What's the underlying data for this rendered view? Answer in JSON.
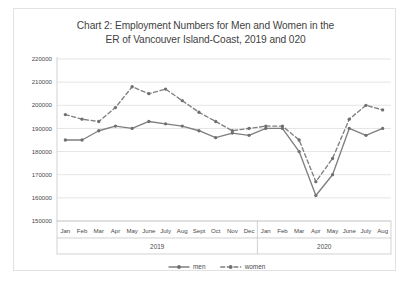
{
  "chart_data": {
    "type": "line",
    "title": "Chart 2: Employment Numbers for Men and Women in the ER of Vancouver Island-Coast, 2019 and 020",
    "title_line1": "Chart 2: Employment Numbers for Men and Women in the",
    "title_line2": "ER of Vancouver Island-Coast, 2019 and 020",
    "xlabel": "",
    "ylabel": "",
    "ylim": [
      150000,
      220000
    ],
    "ytick_step": 10000,
    "ytick_labels": [
      "220000",
      "210000",
      "200000",
      "190000",
      "180000",
      "170000",
      "160000",
      "150000"
    ],
    "ytick_values": [
      220000,
      210000,
      200000,
      190000,
      180000,
      170000,
      160000,
      150000
    ],
    "grid": true,
    "grid_axis": "y",
    "legend_position": "bottom",
    "categories": [
      "Jan",
      "Feb",
      "Mar",
      "Apr",
      "May",
      "June",
      "July",
      "Aug",
      "Sept",
      "Oct",
      "Nov",
      "Dec",
      "Jan",
      "Feb",
      "Mar",
      "Apr",
      "May",
      "June",
      "July",
      "Aug"
    ],
    "group_labels": [
      {
        "label": "2019",
        "start_index": 0,
        "end_index": 11
      },
      {
        "label": "2020",
        "start_index": 12,
        "end_index": 19
      }
    ],
    "series": [
      {
        "name": "men",
        "style": "solid",
        "color": "#7f7f7f",
        "values": [
          185000,
          185000,
          189000,
          191000,
          190000,
          193000,
          192000,
          191000,
          189000,
          186000,
          188000,
          187000,
          190000,
          190000,
          180000,
          161000,
          170000,
          190000,
          187000,
          190000
        ]
      },
      {
        "name": "women",
        "style": "dashed",
        "color": "#7f7f7f",
        "values": [
          196000,
          194000,
          193000,
          199000,
          208000,
          205000,
          207000,
          202000,
          197000,
          193000,
          189000,
          190000,
          191000,
          191000,
          185000,
          167000,
          177000,
          194000,
          200000,
          198000
        ]
      }
    ],
    "legend": [
      {
        "label": "men",
        "style": "solid"
      },
      {
        "label": "women",
        "style": "dashed"
      }
    ]
  }
}
